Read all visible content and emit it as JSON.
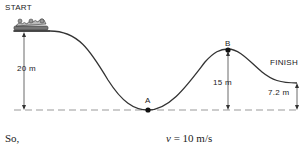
{
  "labels": {
    "start": "START",
    "finish": "FINISH",
    "point_a": "A",
    "point_b": "B"
  },
  "heights": {
    "start_height": "20 m",
    "b_height": "15 m",
    "finish_height": "7.2 m"
  },
  "caption": {
    "prefix": "So,",
    "equation_var": "v",
    "equation_rest": " = 10 m/s"
  },
  "colors": {
    "track": "#333333",
    "dashed_baseline": "#999999",
    "text": "#222222"
  }
}
